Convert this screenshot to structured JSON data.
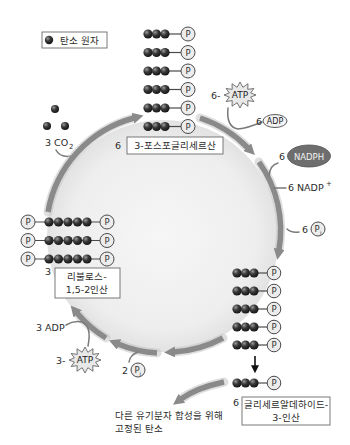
{
  "legend": {
    "label": "탄소 원자",
    "icon": "carbon-atom-ball"
  },
  "phosphate_label": "P",
  "co2_input": {
    "count_formula": "3 CO",
    "subscript": "2"
  },
  "pga": {
    "count": "6",
    "label": "3-포스포글리세르산",
    "chains": 6,
    "carbons_per_chain": 3
  },
  "atp_top": {
    "count": "6-",
    "label": "ATP"
  },
  "adp_top": {
    "count": "6",
    "label": "ADP"
  },
  "nadph": {
    "count": "6",
    "label": "NADPH"
  },
  "nadp": {
    "count": "6",
    "label": "NADP",
    "superscript": "+"
  },
  "pi_right": {
    "count": "6",
    "label": "P",
    "subscript": "i"
  },
  "g3p": {
    "count": "6",
    "line1": "글리세르알데하이드-",
    "line2": "3-인산",
    "chains_in_cycle": 5,
    "chains_exported": 1,
    "carbons_per_chain": 3
  },
  "rubp": {
    "count": "3",
    "line1": "리불로스-",
    "line2": "1,5-2인산",
    "chains": 3,
    "carbons_per_chain": 5
  },
  "adp_bottom": {
    "label": "3 ADP"
  },
  "atp_bottom": {
    "count": "3-",
    "label": "ATP"
  },
  "pi_bottom": {
    "count": "2",
    "label": "P",
    "subscript": "i"
  },
  "output": {
    "line1": "다른 유기분자 합성을 위해",
    "line2": "고정된 탄소"
  },
  "colors": {
    "arrow": "#8a8a8a",
    "carbon": "#2a2a2a",
    "phosphate_fill": "#ececec",
    "nadph_fill": "#6e6e6e",
    "cycle_fill": "#ececec"
  }
}
